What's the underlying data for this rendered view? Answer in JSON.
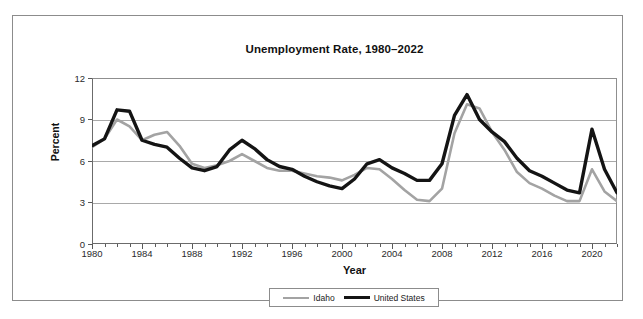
{
  "chart_data": {
    "type": "line",
    "title": "Unemployment Rate, 1980–2022",
    "xlabel": "Year",
    "ylabel": "Percent",
    "ylim": [
      0,
      12
    ],
    "xlim": [
      1980,
      2022
    ],
    "yticks": [
      0,
      3,
      6,
      9,
      12
    ],
    "ytick_labels": [
      "0",
      "3",
      "6",
      "9",
      "12"
    ],
    "xticks": [
      1980,
      1984,
      1988,
      1992,
      1996,
      2000,
      2004,
      2008,
      2012,
      2016,
      2020
    ],
    "xtick_labels": [
      "1980",
      "1984",
      "1988",
      "1992",
      "1996",
      "2000",
      "2004",
      "2008",
      "2012",
      "2016",
      "2020"
    ],
    "x_minor_tick_interval": 1,
    "grid": "horizontal",
    "legend_position": "bottom-center",
    "x": [
      1980,
      1981,
      1982,
      1983,
      1984,
      1985,
      1986,
      1987,
      1988,
      1989,
      1990,
      1991,
      1992,
      1993,
      1994,
      1995,
      1996,
      1997,
      1998,
      1999,
      2000,
      2001,
      2002,
      2003,
      2004,
      2005,
      2006,
      2007,
      2008,
      2009,
      2010,
      2011,
      2012,
      2013,
      2014,
      2015,
      2016,
      2017,
      2018,
      2019,
      2020,
      2021,
      2022
    ],
    "series": [
      {
        "name": "Idaho",
        "color": "#a3a3a3",
        "line_width": 2.6,
        "values": [
          7.0,
          7.6,
          9.0,
          8.5,
          7.5,
          7.9,
          8.1,
          7.1,
          5.8,
          5.5,
          5.7,
          6.0,
          6.5,
          6.0,
          5.5,
          5.3,
          5.3,
          5.1,
          4.9,
          4.8,
          4.6,
          5.0,
          5.5,
          5.4,
          4.7,
          3.9,
          3.2,
          3.1,
          4.0,
          8.0,
          10.1,
          9.8,
          8.1,
          6.8,
          5.2,
          4.4,
          4.0,
          3.5,
          3.1,
          3.1,
          5.4,
          3.8,
          3.1
        ]
      },
      {
        "name": "United States",
        "color": "#141414",
        "line_width": 3.4,
        "values": [
          7.1,
          7.6,
          9.7,
          9.6,
          7.5,
          7.2,
          7.0,
          6.2,
          5.5,
          5.3,
          5.6,
          6.8,
          7.5,
          6.9,
          6.1,
          5.6,
          5.4,
          4.9,
          4.5,
          4.2,
          4.0,
          4.7,
          5.8,
          6.1,
          5.5,
          5.1,
          4.6,
          4.6,
          5.8,
          9.3,
          10.8,
          9.0,
          8.1,
          7.4,
          6.2,
          5.3,
          4.9,
          4.4,
          3.9,
          3.7,
          8.3,
          5.4,
          3.7
        ]
      }
    ]
  },
  "legend": {
    "entries": [
      {
        "label": "Idaho",
        "swatch": "gray-line-swatch"
      },
      {
        "label": "United States",
        "swatch": "black-line-swatch"
      }
    ]
  },
  "footer": {
    "smudge_text": ""
  }
}
